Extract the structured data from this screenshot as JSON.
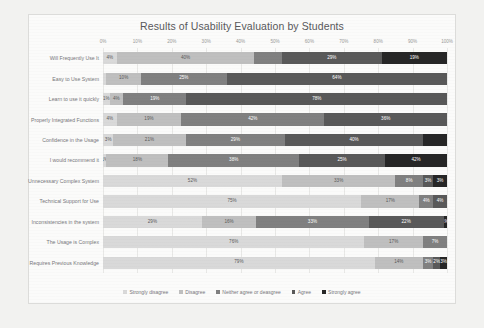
{
  "chart_data": {
    "type": "bar",
    "orientation": "horizontal",
    "stacked": true,
    "stack_mode": "percent",
    "title": "Results of Usability Evaluation by Students",
    "xlabel": "",
    "ylabel": "",
    "xlim": [
      0,
      100
    ],
    "xticks": [
      "0%",
      "10%",
      "20%",
      "30%",
      "40%",
      "50%",
      "60%",
      "70%",
      "80%",
      "90%",
      "100%"
    ],
    "xtick_values": [
      0,
      10,
      20,
      30,
      40,
      50,
      60,
      70,
      80,
      90,
      100
    ],
    "grid": true,
    "legend_position": "bottom",
    "legend": [
      "Strongly disagree",
      "Disagree",
      "Neither agree or deasgree",
      "Agree",
      "Strongly agree"
    ],
    "colors": [
      "#d9d9d9",
      "#bfbfbf",
      "#808080",
      "#595959",
      "#262626"
    ],
    "label_colors": [
      "#595959",
      "#595959",
      "#ffffff",
      "#ffffff",
      "#ffffff"
    ],
    "categories": [
      "Will Frequently Use It",
      "Easy to Use System",
      "Learn to use it quickly",
      "Properly Integrated Functions",
      "Confidence in the Usage",
      "I would recommend it",
      "Unnecessary Complex System",
      "Technical Support for Use",
      "Inconsistencies in the system",
      "The Usage is Complex",
      "Requires Previous Knowledge"
    ],
    "series": [
      {
        "name": "Strongly disagree",
        "values": [
          4,
          1,
          2,
          4,
          3,
          1,
          52,
          75,
          29,
          76,
          79
        ]
      },
      {
        "name": "Disagree",
        "values": [
          40,
          10,
          4,
          19,
          21,
          18,
          33,
          17,
          16,
          17,
          14
        ]
      },
      {
        "name": "Neither agree or deasgree",
        "values": [
          8,
          25,
          19,
          42,
          29,
          38,
          8,
          4,
          33,
          7,
          3
        ]
      },
      {
        "name": "Agree",
        "values": [
          29,
          64,
          78,
          36,
          40,
          25,
          3,
          4,
          22,
          0,
          2
        ]
      },
      {
        "name": "Strongly agree",
        "values": [
          19,
          0,
          0,
          0,
          7,
          18,
          4,
          0,
          1,
          0,
          2
        ]
      }
    ],
    "bar_labels": [
      [
        "4%",
        "40%",
        "",
        "29%",
        "19%"
      ],
      [
        "",
        "10%",
        "25%",
        "64%",
        ""
      ],
      [
        "1%",
        "4%",
        "19%",
        "78%",
        ""
      ],
      [
        "4%",
        "19%",
        "42%",
        "36%",
        ""
      ],
      [
        "3%",
        "21%",
        "29%",
        "40%",
        ""
      ],
      [
        "1%",
        "18%",
        "38%",
        "25%",
        "42%"
      ],
      [
        "52%",
        "33%",
        "8%",
        "3%",
        "3%"
      ],
      [
        "75%",
        "17%",
        "4%",
        "4%",
        ""
      ],
      [
        "29%",
        "16%",
        "33%",
        "22%",
        "1%"
      ],
      [
        "76%",
        "17%",
        "7%",
        "",
        ""
      ],
      [
        "79%",
        "14%",
        "3%",
        "2%",
        "3%"
      ]
    ]
  }
}
